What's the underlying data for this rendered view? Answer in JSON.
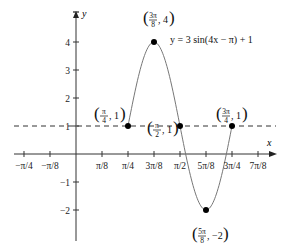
{
  "chart_data": {
    "type": "line",
    "title": "",
    "equation": "y = 3 sin(4x − π) + 1",
    "xlabel": "x",
    "ylabel": "y",
    "x_ticks": [
      "−π/4",
      "−π/8",
      "π/8",
      "π/4",
      "3π/8",
      "π/2",
      "5π/8",
      "3π/4",
      "7π/8"
    ],
    "x_tick_values": [
      -0.7854,
      -0.3927,
      0.3927,
      0.7854,
      1.1781,
      1.5708,
      1.9635,
      2.3562,
      2.7489
    ],
    "y_ticks": [
      "4",
      "3",
      "2",
      "1",
      "−1",
      "−2"
    ],
    "y_tick_values": [
      4,
      3,
      2,
      1,
      -1,
      -2
    ],
    "xlim": [
      -0.95,
      2.95
    ],
    "ylim": [
      -3.1,
      4.9
    ],
    "grid": false,
    "midline": {
      "y": 1,
      "style": "dashed"
    },
    "series": [
      {
        "name": "y = 3 sin(4x − π) + 1",
        "x_start": 0.7854,
        "x_end": 2.3562,
        "amplitude": 3,
        "frequency": 4,
        "phase": -3.1416,
        "offset": 1
      }
    ],
    "key_points": [
      {
        "label_num": "π",
        "label_den": "4",
        "y": "1",
        "x_value": 0.7854,
        "y_value": 1
      },
      {
        "label_num": "3π",
        "label_den": "8",
        "y": "4",
        "x_value": 1.1781,
        "y_value": 4
      },
      {
        "label_num": "π",
        "label_den": "2",
        "y": "1",
        "x_value": 1.5708,
        "y_value": 1
      },
      {
        "label_num": "5π",
        "label_den": "8",
        "y": "−2",
        "x_value": 1.9635,
        "y_value": -2
      },
      {
        "label_num": "3π",
        "label_den": "4",
        "y": "1",
        "x_value": 2.3562,
        "y_value": 1
      }
    ]
  },
  "labels": {
    "x_axis": "x",
    "y_axis": "y",
    "equation": "y = 3 sin(4x − π) + 1"
  }
}
